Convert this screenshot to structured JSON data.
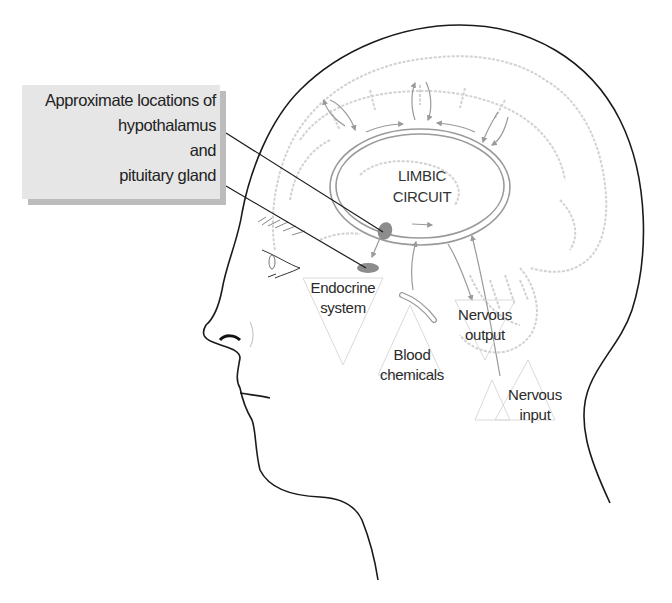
{
  "callout": {
    "lines": [
      "Approximate locations of",
      "hypothalamus",
      "and",
      "pituitary gland"
    ]
  },
  "center_label": {
    "line1": "LIMBIC",
    "line2": "CIRCUIT"
  },
  "labels": {
    "endocrine": {
      "line1": "Endocrine",
      "line2": "system"
    },
    "blood": {
      "line1": "Blood",
      "line2": "chemicals"
    },
    "nervous_output": {
      "line1": "Nervous",
      "line2": "output"
    },
    "nervous_input": {
      "line1": "Nervous",
      "line2": "input"
    }
  },
  "colors": {
    "outline": "#1a1a1a",
    "brain": "#cfcfcf",
    "circuit": "#9a9a9a",
    "gland": "#8c8c8c",
    "callout_bg": "#e6e6e6",
    "callout_shadow": "#bcbcbc"
  }
}
